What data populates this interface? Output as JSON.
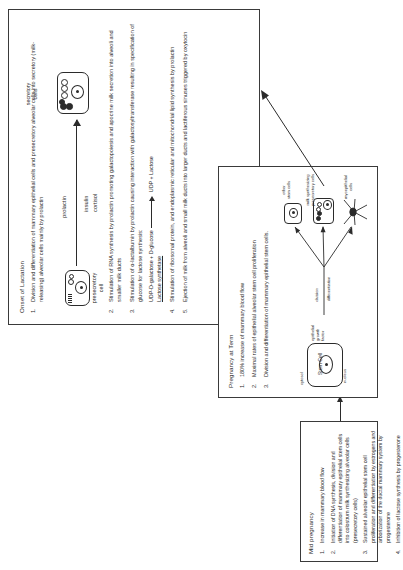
{
  "figure": {
    "orientation_note": "rotated"
  },
  "lactation": {
    "title": "Onset of Lactation",
    "items": [
      {
        "n": "1.",
        "text": "Division and differentiation of mammary epithelial cells and presecretory alveolar cells into secretory (milk-releasing) alveolar cells mainly by prolactin"
      },
      {
        "n": "2.",
        "text": "Stimulation of RNA synthesis by prolactin promoting galactopoiesis and apocrine milk secretion into alveoli and smaller milk ducts"
      },
      {
        "n": "3.",
        "text": "Stimulation of α-lactalbumin by prolactin causing interaction with galactosyltransferase resulting in specification of glucose for lactose synthesis:"
      },
      {
        "n": "4.",
        "text": "Stimulation of ribosomal protein, and endoplasmic reticular and mitochondrial lipid synthesis by prolactin"
      },
      {
        "n": "5.",
        "text": "Ejection of milk from alveoli and small milk ducts into larger ducts and lactiferous sinuses triggered by oxytocin"
      }
    ],
    "reaction": {
      "left": "UDP-D-galactose + D-glucose",
      "right": "UDP + Lactose",
      "enzyme": "Lactose synthetase"
    },
    "cells": {
      "source_label": "presecretory\ncell",
      "target_label": "secretory\ncells"
    },
    "hormones_above": "prolactin",
    "hormones_below": [
      "insulin",
      "cortisol"
    ]
  },
  "mid_pregnancy": {
    "title": "Mid pregnancy",
    "items": [
      {
        "n": "1.",
        "text": "Increase in mammary blood flow"
      },
      {
        "n": "2.",
        "text": "Initiation of DNA synthesis, division and differentiation of mammary epithelial stem cells into colostrum milk synthesizing alveolar cells (presecretory cells)"
      },
      {
        "n": "3.",
        "text": "Sustained alveolar epithelial stem cell proliferation and differentiation by estrogens and arborization of the ductal mammary system by progesterone"
      },
      {
        "n": "4.",
        "text": "Inhibition of lactose synthesis by progesterone"
      }
    ]
  },
  "pregnancy_at_term": {
    "title": "Pregnancy at Term",
    "items": [
      {
        "n": "1.",
        "text": "180% increase of mammary blood flow"
      },
      {
        "n": "2.",
        "text": "Maximal rates of epithelial alveolar stem cell proliferation"
      },
      {
        "n": "3.",
        "text": "Division and differentiation of mammary epithelial stem cells."
      }
    ],
    "diagram": {
      "stem_cell_label": "Stem Cell",
      "stem_cell_top_label": "cytosol",
      "stem_cell_bottom_label": "nucleus",
      "growth_factor_label": "epithelial\ngrowth\nfactor",
      "process_labels": [
        "division",
        "differentiation"
      ],
      "outputs": [
        "other\nstem cells",
        "milk synthesizing\npresecretory cells",
        "myoepithelial\ncells"
      ]
    }
  },
  "colors": {
    "ink": "#2b2b2b",
    "border": "#3a3a3a",
    "paper": "#ffffff"
  }
}
